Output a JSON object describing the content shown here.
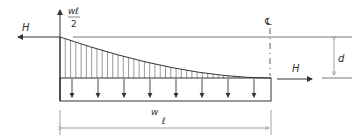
{
  "diagram": {
    "labels": {
      "H_left": "H",
      "H_right": "H",
      "reaction_num": "wℓ",
      "reaction_den": "2",
      "centerline": "℄",
      "sag": "d",
      "load": "w",
      "span": "ℓ"
    },
    "colors": {
      "line": "#333333",
      "dim": "#888888",
      "background": "#ffffff"
    },
    "load_arrow_count": 8,
    "hatch_count": 40
  }
}
